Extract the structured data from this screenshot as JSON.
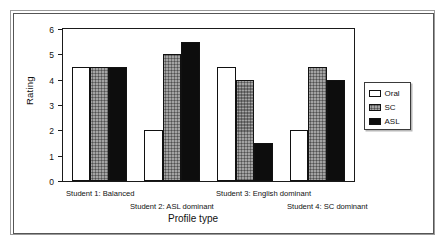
{
  "chart_data": {
    "type": "bar",
    "title": "",
    "xlabel": "Profile type",
    "ylabel": "Rating",
    "ylim": [
      0,
      6
    ],
    "yticks": [
      0,
      1,
      2,
      3,
      4,
      5,
      6
    ],
    "grid": false,
    "legend_position": "right-outside",
    "categories": [
      "Student 1: Balanced",
      "Student 2: ASL dominant",
      "Student 3: English dominant",
      "Student 4: SC dominant"
    ],
    "series": [
      {
        "name": "Oral",
        "color": "#ffffff",
        "values": [
          4.5,
          2.0,
          4.5,
          2.0
        ]
      },
      {
        "name": "SC",
        "color": "#a3a3a3",
        "values": [
          4.5,
          5.0,
          4.0,
          4.5
        ]
      },
      {
        "name": "ASL",
        "color": "#0d0d0d",
        "values": [
          4.5,
          5.5,
          1.5,
          4.0
        ]
      }
    ]
  },
  "axis": {
    "y_title": "Rating",
    "x_title": "Profile type",
    "y_tick_labels": [
      "0",
      "1",
      "2",
      "3",
      "4",
      "5",
      "6"
    ]
  },
  "legend": {
    "entries": [
      {
        "label": "Oral",
        "swatch": "white-swatch"
      },
      {
        "label": "SC",
        "swatch": "gray-hatched-swatch"
      },
      {
        "label": "ASL",
        "swatch": "black-swatch"
      }
    ]
  },
  "x_tick_labels": [
    "Student 1: Balanced",
    "Student 2: ASL dominant",
    "Student 3: English dominant",
    "Student 4: SC dominant"
  ]
}
